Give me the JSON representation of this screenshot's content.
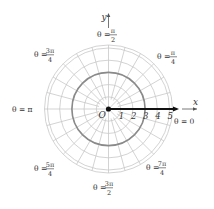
{
  "diagram": {
    "type": "polar-grid",
    "center": {
      "x": 108.5,
      "y": 109
    },
    "unit_px": 12.2,
    "ring_count": 5,
    "highlight_ring_radius": 3,
    "radial_step_deg": 15,
    "axes": {
      "x_label": "x",
      "y_label": "y",
      "origin_label": "O"
    },
    "ticks": [
      "1",
      "2",
      "3",
      "4",
      "5"
    ],
    "angle_labels": [
      {
        "id": "zero",
        "text": "θ = 0"
      },
      {
        "id": "pi4",
        "num": "π",
        "den": "4"
      },
      {
        "id": "pi2",
        "num": "π",
        "den": "2"
      },
      {
        "id": "3pi4",
        "num": "3π",
        "den": "4"
      },
      {
        "id": "pi",
        "text": "θ = π"
      },
      {
        "id": "5pi4",
        "num": "5π",
        "den": "4"
      },
      {
        "id": "3pi2",
        "num": "3π",
        "den": "2"
      },
      {
        "id": "7pi4",
        "num": "7π",
        "den": "4"
      }
    ],
    "colors": {
      "grid": "#c8c8c8",
      "highlight_ring": "#8a8a8a",
      "ray": "#111111",
      "text": "#333333"
    }
  }
}
